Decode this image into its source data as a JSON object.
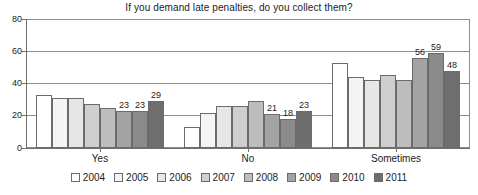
{
  "chart_data": {
    "type": "bar",
    "title": "If you demand late penalties, do you collect them?",
    "xlabel": "",
    "ylabel": "",
    "ylim": [
      0,
      80
    ],
    "yticks": [
      0,
      20,
      40,
      60,
      80
    ],
    "grid": true,
    "legend_position": "bottom",
    "categories": [
      "Yes",
      "No",
      "Sometimes"
    ],
    "series": [
      {
        "name": "2004",
        "color": "#ffffff",
        "values": [
          33,
          13,
          53
        ],
        "labels": [
          "",
          "",
          ""
        ]
      },
      {
        "name": "2005",
        "color": "#f4f4f4",
        "values": [
          31,
          22,
          44
        ],
        "labels": [
          "",
          "",
          ""
        ]
      },
      {
        "name": "2006",
        "color": "#e6e6e6",
        "values": [
          31,
          26,
          42
        ],
        "labels": [
          "",
          "",
          ""
        ]
      },
      {
        "name": "2007",
        "color": "#cfcfcf",
        "values": [
          27,
          26,
          45
        ],
        "labels": [
          "",
          "",
          ""
        ]
      },
      {
        "name": "2008",
        "color": "#bdbdbd",
        "values": [
          25,
          29,
          42
        ],
        "labels": [
          "",
          "",
          ""
        ]
      },
      {
        "name": "2009",
        "color": "#a3a3a3",
        "values": [
          23,
          21,
          56
        ],
        "labels": [
          "23",
          "21",
          "56"
        ]
      },
      {
        "name": "2010",
        "color": "#8a8a8a",
        "values": [
          23,
          18,
          59
        ],
        "labels": [
          "23",
          "18",
          "59"
        ]
      },
      {
        "name": "2011",
        "color": "#6e6e6e",
        "values": [
          29,
          23,
          48
        ],
        "labels": [
          "29",
          "23",
          "48"
        ]
      }
    ]
  },
  "axis": {
    "tick_0": "0",
    "tick_20": "20",
    "tick_40": "40",
    "tick_60": "60",
    "tick_80": "80"
  },
  "colors": {
    "frame": "#8d8d8d",
    "gridline": "#8d8d8d",
    "bar_border": "#6b6b6b",
    "text": "#1c1c1c",
    "background": "#ffffff"
  }
}
